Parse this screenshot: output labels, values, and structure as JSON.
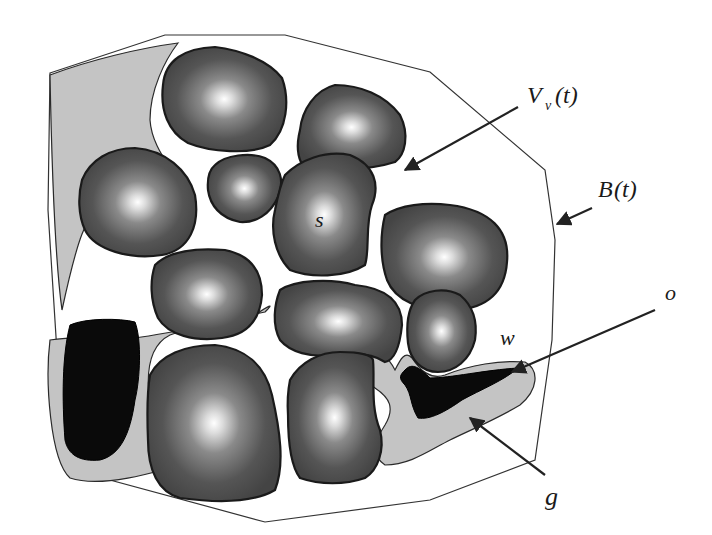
{
  "diagram": {
    "type": "porous-medium-schematic",
    "labels": {
      "void_volume": "V",
      "void_volume_subscript": "v",
      "void_volume_arg": "(t)",
      "boundary": "B",
      "boundary_arg": "(t)",
      "solid": "s",
      "water": "w",
      "oil": "o",
      "gas": "g"
    },
    "colors": {
      "grain_edge": "#1a1a1a",
      "grain_fill_dark": "#4a4a4a",
      "grain_fill_center": "#ffffff",
      "water_fill": "#c4c4c4",
      "oil_fill": "#0a0a0a",
      "boundary_line": "#333333",
      "background": "#ffffff"
    },
    "grain_count": 13,
    "water_regions": 4,
    "dark_phase_regions": 2
  }
}
